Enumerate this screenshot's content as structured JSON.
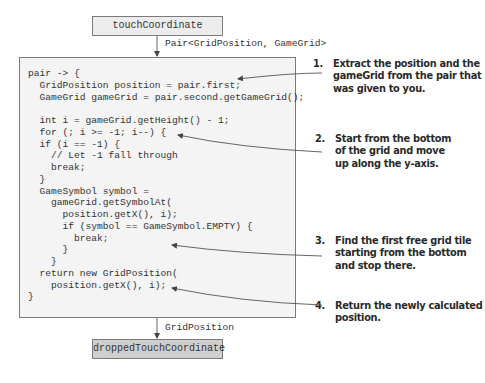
{
  "nodes": {
    "top": {
      "label": "touchCoordinate"
    },
    "bottom": {
      "label": "droppedTouchCoordinate"
    }
  },
  "edges": {
    "input_type": "Pair<GridPosition, GameGrid>",
    "output_type": "GridPosition"
  },
  "code": {
    "lines": [
      "pair -> {",
      "  GridPosition position = pair.first;",
      "  GameGrid gameGrid = pair.second.getGameGrid();",
      "",
      "  int i = gameGrid.getHeight() - 1;",
      "  for (; i >= -1; i--) {",
      "  if (i == -1) {",
      "    // Let -1 fall through",
      "    break;",
      "  }",
      "  GameSymbol symbol =",
      "    gameGrid.getSymbolAt(",
      "      position.getX(), i);",
      "      if (symbol == GameSymbol.EMPTY) {",
      "        break;",
      "      }",
      "    }",
      "  return new GridPosition(",
      "    position.getX(), i);",
      "}"
    ]
  },
  "annotations": [
    {
      "number": "1.",
      "lines": [
        "Extract the position and the",
        "gameGrid from the pair that",
        "was given to you."
      ]
    },
    {
      "number": "2.",
      "lines": [
        "Start from the bottom",
        "of the grid and move",
        "up along the y-axis."
      ]
    },
    {
      "number": "3.",
      "lines": [
        "Find the first free grid tile",
        "starting from the bottom",
        "and stop there."
      ]
    },
    {
      "number": "4.",
      "lines": [
        "Return the newly calculated",
        "position."
      ]
    }
  ],
  "colors": {
    "top_node_fill": "#ececec",
    "bottom_node_fill": "#cfcfcf",
    "code_box_fill": "#f4f4f4",
    "border": "#7a7a7a",
    "text": "#333333"
  }
}
